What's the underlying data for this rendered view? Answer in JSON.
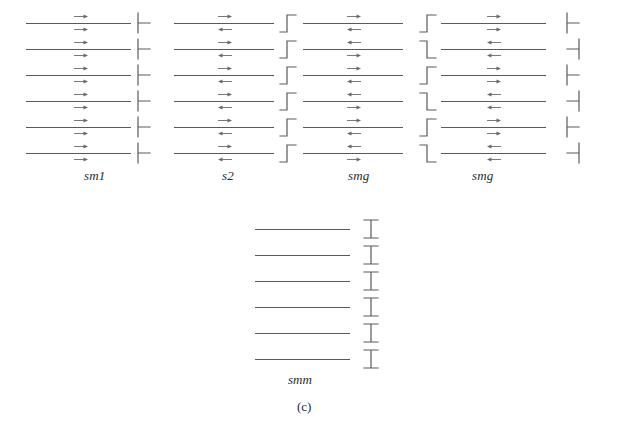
{
  "figure": {
    "caption": "(c)",
    "caption_x": 297,
    "caption_y": 399,
    "background": "#ffffff",
    "line_color": "#5a5a5a",
    "arrow_color": "#6a6a6a",
    "text_color": "#2a2a2a"
  },
  "groups": [
    {
      "id": "group-sm1",
      "label": "sm1",
      "label_x": 84,
      "label_y": 168,
      "x": 26,
      "y": 10,
      "line_length": 105,
      "row_height": 26,
      "row_count": 6,
      "symbol_x": 133,
      "symbols": [
        "left-tee",
        "left-tee",
        "left-tee",
        "left-tee",
        "left-tee",
        "left-tee"
      ],
      "arrows_above": [
        "right",
        "right",
        "right",
        "right",
        "right",
        "right"
      ],
      "arrows_below": [
        "right",
        "right",
        "right",
        "right",
        "right",
        "right"
      ],
      "arrow_offset": 48
    },
    {
      "id": "group-s2",
      "label": "s2",
      "label_x": 222,
      "label_y": 168,
      "x": 174,
      "y": 10,
      "line_length": 100,
      "row_height": 26,
      "row_count": 6,
      "symbol_x": 277,
      "symbols": [
        "step-up",
        "step-up",
        "step-up",
        "step-up",
        "step-up",
        "step-up"
      ],
      "arrows_above": [
        "right",
        "right",
        "right",
        "right",
        "right",
        "right"
      ],
      "arrows_below": [
        "left",
        "left",
        "left",
        "left",
        "left",
        "left"
      ],
      "arrow_offset": 44
    },
    {
      "id": "group-smg-3",
      "label": "smg",
      "label_x": 348,
      "label_y": 168,
      "x": 303,
      "y": 10,
      "line_length": 100,
      "row_height": 26,
      "row_count": 6,
      "symbol_x": 417,
      "symbols": [
        "step-up",
        "step-down",
        "step-up",
        "step-down",
        "step-up",
        "step-down"
      ],
      "arrows_above": [
        "right",
        "left",
        "right",
        "left",
        "right",
        "left"
      ],
      "arrows_below": [
        "left",
        "right",
        "left",
        "right",
        "left",
        "right"
      ],
      "arrow_offset": 44
    },
    {
      "id": "group-smg-4",
      "label": "smg",
      "label_x": 472,
      "label_y": 168,
      "x": 441,
      "y": 10,
      "line_length": 105,
      "row_height": 26,
      "row_count": 6,
      "symbol_x": 562,
      "symbols": [
        "left-tee",
        "right-tee",
        "left-tee",
        "right-tee",
        "left-tee",
        "right-tee"
      ],
      "arrows_above": [
        "right",
        "left",
        "right",
        "left",
        "right",
        "left"
      ],
      "arrows_below": [
        "right",
        "left",
        "right",
        "left",
        "right",
        "left"
      ],
      "arrow_offset": 46
    },
    {
      "id": "group-smm",
      "label": "smm",
      "label_x": 288,
      "label_y": 372,
      "x": 255,
      "y": 216,
      "line_length": 95,
      "row_height": 26,
      "row_count": 6,
      "symbol_x": 360,
      "symbols": [
        "i-beam",
        "i-beam",
        "i-beam",
        "i-beam",
        "i-beam",
        "i-beam"
      ],
      "arrows_above": [
        "none",
        "none",
        "none",
        "none",
        "none",
        "none"
      ],
      "arrows_below": [
        "none",
        "none",
        "none",
        "none",
        "none",
        "none"
      ],
      "arrow_offset": 0
    }
  ]
}
